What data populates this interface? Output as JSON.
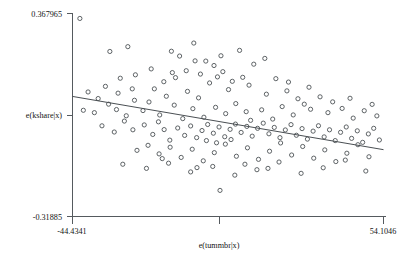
{
  "chart_data": {
    "type": "scatter",
    "title": "",
    "xlabel": "e(tummbr|x)",
    "ylabel": "e(kshare|x)",
    "xlim": [
      -44.4341,
      54.1046
    ],
    "ylim": [
      -0.31885,
      0.367965
    ],
    "xticks": [
      "-44.4341",
      "54.1046"
    ],
    "yticks": [
      "0.367965",
      "-0.31885"
    ],
    "grid": false,
    "legend": null,
    "marker": "open-circle",
    "fit_line": {
      "type": "linear",
      "x_start": -44.4341,
      "y_start": 0.0874,
      "x_end": 54.1046,
      "y_end": -0.0927
    },
    "points": [
      [
        -42.1,
        0.3512
      ],
      [
        -32.6,
        0.2395
      ],
      [
        -26.9,
        0.2558
      ],
      [
        -13.1,
        0.2403
      ],
      [
        -5.6,
        0.2077
      ],
      [
        -2.2,
        0.207
      ],
      [
        -8.4,
        0.1744
      ],
      [
        -11.8,
        0.151
      ],
      [
        -3.9,
        0.163
      ],
      [
        0.4,
        0.192
      ],
      [
        3.2,
        0.1712
      ],
      [
        -18.5,
        0.113
      ],
      [
        -14.7,
        0.088
      ],
      [
        -20.2,
        0.0686
      ],
      [
        -24.8,
        0.0744
      ],
      [
        -36.3,
        0.0802
      ],
      [
        -30.5,
        0.043
      ],
      [
        -27.4,
        0.022
      ],
      [
        -22.1,
        0.0395
      ],
      [
        -16.8,
        0.0246
      ],
      [
        -12.2,
        0.058
      ],
      [
        -9.5,
        0.0123
      ],
      [
        -6.3,
        0.046
      ],
      [
        -2.8,
        0.017
      ],
      [
        0.9,
        0.0505
      ],
      [
        4.1,
        0.0292
      ],
      [
        7.3,
        0.0632
      ],
      [
        10.6,
        0.0358
      ],
      [
        -35.1,
        -0.012
      ],
      [
        -31.2,
        -0.033
      ],
      [
        -28.0,
        0.004
      ],
      [
        -25.3,
        -0.0255
      ],
      [
        -21.7,
        -0.009
      ],
      [
        -19.0,
        -0.0412
      ],
      [
        -17.2,
        0.0015
      ],
      [
        -15.4,
        -0.0248
      ],
      [
        -13.6,
        -0.0605
      ],
      [
        -11.1,
        -0.0195
      ],
      [
        -8.9,
        -0.0445
      ],
      [
        -7.0,
        -0.0125
      ],
      [
        -5.1,
        -0.052
      ],
      [
        -3.4,
        -0.028
      ],
      [
        -1.6,
        -0.0075
      ],
      [
        0.2,
        -0.037
      ],
      [
        2.0,
        -0.016
      ],
      [
        3.8,
        -0.049
      ],
      [
        5.5,
        -0.024
      ],
      [
        7.2,
        -0.0062
      ],
      [
        9.0,
        -0.0345
      ],
      [
        10.8,
        -0.014
      ],
      [
        12.5,
        -0.047
      ],
      [
        14.2,
        -0.0205
      ],
      [
        16.0,
        -0.003
      ],
      [
        17.8,
        -0.039
      ],
      [
        19.5,
        -0.0175
      ],
      [
        21.3,
        -0.052
      ],
      [
        23.0,
        -0.026
      ],
      [
        24.8,
        -0.008
      ],
      [
        26.5,
        -0.044
      ],
      [
        28.3,
        -0.0215
      ],
      [
        30.0,
        -0.057
      ],
      [
        31.8,
        -0.03
      ],
      [
        33.5,
        -0.0118
      ],
      [
        35.3,
        -0.0495
      ],
      [
        37.0,
        -0.0255
      ],
      [
        38.8,
        -0.062
      ],
      [
        40.5,
        -0.034
      ],
      [
        42.3,
        -0.016
      ],
      [
        44.0,
        -0.0545
      ],
      [
        45.8,
        -0.029
      ],
      [
        47.5,
        -0.068
      ],
      [
        49.3,
        -0.0395
      ],
      [
        51.0,
        -0.0205
      ],
      [
        52.8,
        -0.06
      ],
      [
        -24.0,
        -0.095
      ],
      [
        -20.5,
        -0.078
      ],
      [
        -17.0,
        -0.107
      ],
      [
        -13.5,
        -0.0845
      ],
      [
        -10.0,
        -0.119
      ],
      [
        -6.5,
        -0.0912
      ],
      [
        -3.0,
        -0.1305
      ],
      [
        0.5,
        -0.1028
      ],
      [
        4.0,
        -0.074
      ],
      [
        7.5,
        -0.115
      ],
      [
        11.0,
        -0.0865
      ],
      [
        14.5,
        -0.1255
      ],
      [
        18.0,
        -0.098
      ],
      [
        21.5,
        -0.07
      ],
      [
        25.0,
        -0.1108
      ],
      [
        28.5,
        -0.082
      ],
      [
        32.0,
        -0.1215
      ],
      [
        35.5,
        -0.0935
      ],
      [
        39.0,
        -0.133
      ],
      [
        42.5,
        -0.1048
      ],
      [
        46.0,
        -0.076
      ],
      [
        49.5,
        -0.1168
      ],
      [
        -28.5,
        -0.142
      ],
      [
        -21.0,
        -0.156
      ],
      [
        -14.0,
        -0.1385
      ],
      [
        -7.0,
        -0.168
      ],
      [
        0.0,
        -0.1495
      ],
      [
        7.0,
        -0.179
      ],
      [
        14.0,
        -0.1605
      ],
      [
        21.0,
        -0.1345
      ],
      [
        28.0,
        -0.1728
      ],
      [
        35.0,
        -0.154
      ],
      [
        42.0,
        -0.128
      ],
      [
        48.5,
        -0.165
      ],
      [
        -34.0,
        0.1215
      ],
      [
        -29.3,
        0.149
      ],
      [
        -6.0,
        0.268
      ],
      [
        2.6,
        0.225
      ],
      [
        8.5,
        0.2432
      ],
      [
        13.0,
        0.1965
      ],
      [
        16.5,
        0.216
      ],
      [
        20.0,
        0.1475
      ],
      [
        -1.0,
        0.133
      ],
      [
        5.0,
        0.1105
      ],
      [
        11.5,
        0.1255
      ],
      [
        17.0,
        0.095
      ],
      [
        23.5,
        0.1062
      ],
      [
        27.0,
        0.0795
      ],
      [
        30.5,
        0.1185
      ],
      [
        34.0,
        0.086
      ],
      [
        -19.5,
        0.1805
      ],
      [
        -24.5,
        0.1605
      ],
      [
        1.5,
        0.1535
      ],
      [
        6.2,
        0.1385
      ],
      [
        -10.5,
        0.224
      ],
      [
        -15.5,
        0.1372
      ],
      [
        22.0,
        0.053
      ],
      [
        25.5,
        0.0248
      ],
      [
        29.0,
        0.0612
      ],
      [
        36.5,
        0.0325
      ],
      [
        41.0,
        0.0468
      ],
      [
        44.5,
        0.014
      ],
      [
        48.0,
        0.039
      ],
      [
        52.0,
        0.0215
      ],
      [
        2.3,
        -0.2305
      ],
      [
        -4.5,
        0.0825
      ],
      [
        -8.0,
        0.1045
      ],
      [
        12.0,
        0.0065
      ],
      [
        15.5,
        0.042
      ],
      [
        19.0,
        0.0108
      ],
      [
        -25.5,
        0.113
      ],
      [
        -30.0,
        0.0985
      ],
      [
        -33.0,
        0.0612
      ],
      [
        -37.5,
        0.0325
      ],
      [
        -39.5,
        0.1025
      ],
      [
        -41.0,
        0.0405
      ],
      [
        9.5,
        0.152
      ],
      [
        24.0,
        0.136
      ],
      [
        31.0,
        0.044
      ],
      [
        38.0,
        0.069
      ],
      [
        43.5,
        0.0812
      ],
      [
        50.5,
        0.0605
      ],
      [
        -2.0,
        -0.062
      ],
      [
        1.2,
        -0.0695
      ],
      [
        5.8,
        -0.0585
      ],
      [
        -12.8,
        0.168
      ],
      [
        -5.0,
        -0.1535
      ],
      [
        10.2,
        -0.142
      ],
      [
        17.5,
        -0.156
      ],
      [
        -16.0,
        -0.123
      ]
    ]
  }
}
